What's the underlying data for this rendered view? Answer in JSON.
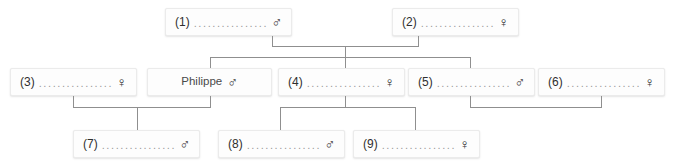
{
  "diagram": {
    "line_color": "#8f8f8f",
    "box_background": "#fdfdfd",
    "box_border": "#ebebeb",
    "dots_leader": "..................",
    "symbols": {
      "male": "♂",
      "female": "♀"
    }
  },
  "people": [
    {
      "id": "p1",
      "label": "(1)",
      "name": "",
      "sex": "male",
      "sex_symbol": "♂",
      "generation": 1,
      "leader": "................."
    },
    {
      "id": "p2",
      "label": "(2)",
      "name": "",
      "sex": "female",
      "sex_symbol": "♀",
      "generation": 1,
      "leader": "................."
    },
    {
      "id": "p3",
      "label": "(3)",
      "name": "",
      "sex": "female",
      "sex_symbol": "♀",
      "generation": 2,
      "leader": "................."
    },
    {
      "id": "pph",
      "label": "Philippe",
      "name": "Philippe",
      "sex": "male",
      "sex_symbol": "♂",
      "generation": 2,
      "leader": ""
    },
    {
      "id": "p4",
      "label": "(4)",
      "name": "",
      "sex": "female",
      "sex_symbol": "♀",
      "generation": 2,
      "leader": "................."
    },
    {
      "id": "p5",
      "label": "(5)",
      "name": "",
      "sex": "male",
      "sex_symbol": "♂",
      "generation": 2,
      "leader": "................."
    },
    {
      "id": "p6",
      "label": "(6)",
      "name": "",
      "sex": "female",
      "sex_symbol": "♀",
      "generation": 2,
      "leader": "................."
    },
    {
      "id": "p7",
      "label": "(7)",
      "name": "",
      "sex": "male",
      "sex_symbol": "♂",
      "generation": 3,
      "leader": "................."
    },
    {
      "id": "p8",
      "label": "(8)",
      "name": "",
      "sex": "male",
      "sex_symbol": "♂",
      "generation": 3,
      "leader": "................."
    },
    {
      "id": "p9",
      "label": "(9)",
      "name": "",
      "sex": "female",
      "sex_symbol": "♀",
      "generation": 3,
      "leader": "................."
    }
  ],
  "unions": [
    {
      "id": "u1",
      "partners": [
        "p1",
        "p2"
      ],
      "children": [
        "pph",
        "p4",
        "p5"
      ]
    },
    {
      "id": "u2",
      "partners": [
        "p3",
        "pph"
      ],
      "children": [
        "p7"
      ]
    },
    {
      "id": "u3",
      "partners": [
        "p4"
      ],
      "children": [
        "p8",
        "p9"
      ]
    },
    {
      "id": "u4",
      "partners": [
        "p5",
        "p6"
      ],
      "children": []
    }
  ]
}
